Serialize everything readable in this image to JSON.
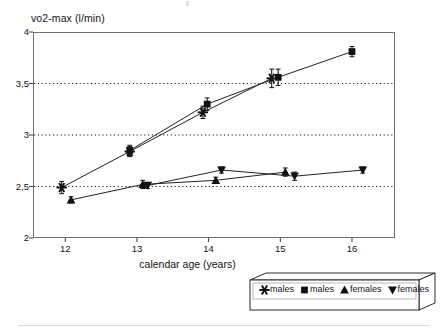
{
  "chart_data": {
    "type": "line",
    "title": "",
    "xlabel": "calendar age (years)",
    "ylabel": "vo2-max (l/min)",
    "xlim": [
      11.55,
      16.6
    ],
    "ylim": [
      2,
      4
    ],
    "xticks": [
      12,
      13,
      14,
      15,
      16
    ],
    "xticklabels": [
      "12",
      "13",
      "14",
      "15",
      "16"
    ],
    "yticks": [
      2,
      2.5,
      3,
      3.5,
      4
    ],
    "yticklabels": [
      "2",
      "2,5",
      "3",
      "3,5",
      "4"
    ],
    "grid": "horizontal-dotted",
    "gridlines_at": [
      2.5,
      3,
      3.5
    ],
    "legend_position": "below-right",
    "errorbars": true,
    "series": [
      {
        "name": "males",
        "marker": "asterisk",
        "legend_label": "males",
        "x": [
          11.95,
          12.9,
          13.92,
          14.88
        ],
        "y": [
          2.49,
          2.84,
          3.22,
          3.55
        ],
        "yerr": [
          0.06,
          0.05,
          0.06,
          0.09
        ]
      },
      {
        "name": "males",
        "marker": "square",
        "legend_label": "males",
        "x": [
          12.9,
          13.98,
          14.97,
          16.0
        ],
        "y": [
          2.85,
          3.3,
          3.56,
          3.81
        ],
        "yerr": [
          0.05,
          0.06,
          0.08,
          0.05
        ]
      },
      {
        "name": "females",
        "marker": "triangle-up",
        "legend_label": "females",
        "x": [
          12.08,
          13.08,
          14.1,
          15.07
        ],
        "y": [
          2.37,
          2.52,
          2.56,
          2.64
        ],
        "yerr": [
          0.03,
          0.04,
          0.03,
          0.04
        ]
      },
      {
        "name": "females",
        "marker": "triangle-down",
        "legend_label": "females",
        "x": [
          13.15,
          14.18,
          15.2,
          16.15
        ],
        "y": [
          2.51,
          2.66,
          2.6,
          2.66
        ],
        "yerr": [
          0.03,
          0.03,
          0.04,
          0.03
        ]
      }
    ]
  },
  "legend": {
    "entries": [
      {
        "marker": "asterisk",
        "label": "males"
      },
      {
        "marker": "square",
        "label": "males"
      },
      {
        "marker": "triangle-up",
        "label": "females"
      },
      {
        "marker": "triangle-down",
        "label": "females"
      }
    ]
  },
  "colors": {
    "ink": "#141414",
    "frame": "#6e6e6e",
    "grid": "#1a1a1a",
    "background": "#ffffff",
    "rule": "#d9d9d9"
  }
}
